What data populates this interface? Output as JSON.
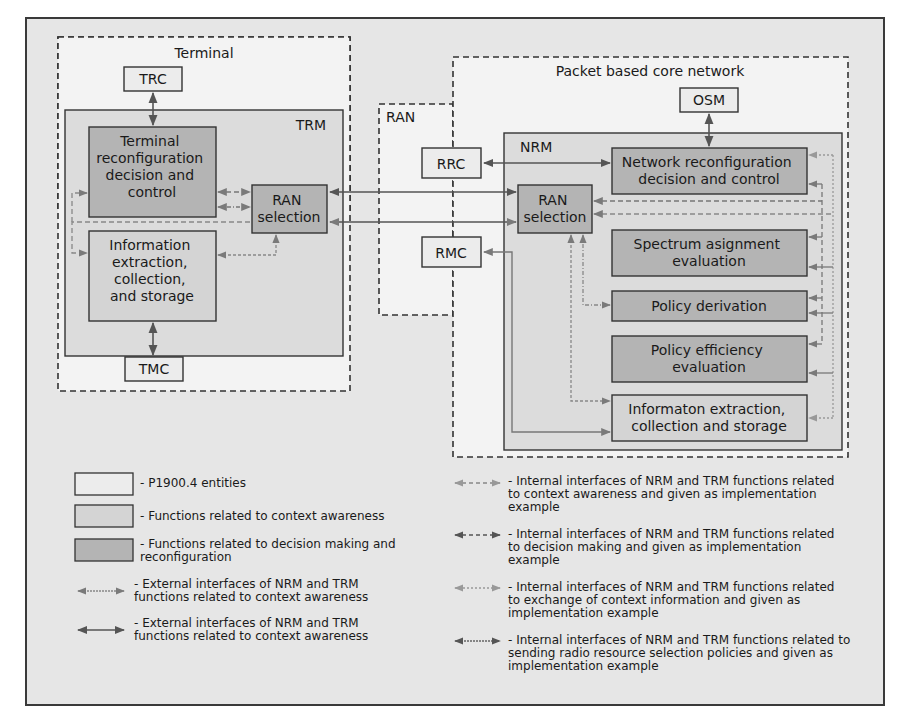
{
  "diagram": {
    "colors": {
      "background": "#e6e6e6",
      "entity_fill": "#ececec",
      "context_fill": "#d4d4d4",
      "decision_fill": "#b4b4b4",
      "stroke": "#3a3a3a",
      "arrow_solid": "#555555",
      "arrow_dashed": "#777777",
      "arrow_dotted": "#999999"
    },
    "regions": {
      "terminal": "Terminal",
      "trm": "TRM",
      "ran": "RAN",
      "core": "Packet based core network",
      "nrm": "NRM"
    },
    "entities": {
      "trc": "TRC",
      "tmc": "TMC",
      "rrc": "RRC",
      "rmc": "RMC",
      "osm": "OSM"
    },
    "trm_functions": {
      "terminal_reconfig": [
        "Terminal",
        "reconfiguration",
        "decision and",
        "control"
      ],
      "info_extraction": [
        "Information",
        "extraction,",
        "collection,",
        "and storage"
      ],
      "ran_selection": [
        "RAN",
        "selection"
      ]
    },
    "nrm_functions": {
      "network_reconfig": [
        "Network reconfiguration",
        "decision and control"
      ],
      "ran_selection": [
        "RAN",
        "selection"
      ],
      "spectrum": [
        "Spectrum asignment",
        "evaluation"
      ],
      "policy_derivation": [
        "Policy derivation"
      ],
      "policy_efficiency": [
        "Policy efficiency",
        "evaluation"
      ],
      "info_extraction": [
        "Informaton extraction,",
        "collection and storage"
      ]
    }
  },
  "legend": {
    "boxes": [
      {
        "label": "- P1900.4 entities"
      },
      {
        "label": "- Functions related to context awareness"
      },
      {
        "label": "- Functions related to decision making and reconfiguration"
      }
    ],
    "lines_left": [
      {
        "label": "- External interfaces of NRM and TRM functions related to context awareness"
      },
      {
        "label": "- External interfaces of NRM and TRM functions related to context awareness"
      }
    ],
    "lines_right": [
      {
        "label": "- Internal interfaces of NRM and TRM functions related to context awareness and given as implementation example"
      },
      {
        "label": "- Internal interfaces of NRM and TRM functions related to decision making and given as implementation example"
      },
      {
        "label": "- Internal interfaces of NRM and TRM functions related to exchange of context information and given as implementation example"
      },
      {
        "label": "- Internal interfaces of NRM and TRM functions related to sending radio resource selection policies and given as implementation example"
      }
    ]
  }
}
